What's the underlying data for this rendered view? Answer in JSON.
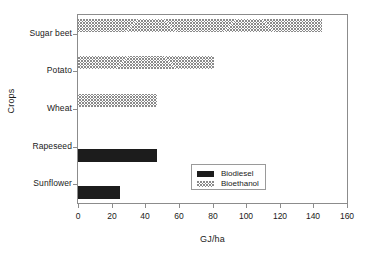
{
  "chart_data": {
    "type": "bar",
    "orientation": "horizontal",
    "title": "",
    "xlabel": "GJ/ha",
    "ylabel": "Crops",
    "categories": [
      "Sunflower",
      "Rapeseed",
      "Wheat",
      "Potato",
      "Sugar beet"
    ],
    "series": [
      {
        "name": "Biodiesel",
        "color": "#1c1c1c",
        "fill": "solid",
        "values": [
          25,
          47,
          null,
          null,
          null
        ]
      },
      {
        "name": "Bioethanol",
        "color": "#8a8a8a",
        "fill": "hatched",
        "values": [
          null,
          null,
          47,
          81,
          145
        ]
      }
    ],
    "xlim": [
      0,
      160
    ],
    "xticks": [
      0,
      20,
      40,
      60,
      80,
      100,
      120,
      140,
      160
    ],
    "xtick_labels": [
      "0",
      "20",
      "40",
      "60",
      "80",
      "100",
      "120",
      "140",
      "160"
    ],
    "grid": false,
    "legend_position": "center-right",
    "legend_entries": [
      "Biodiesel",
      "Bioethanol"
    ]
  },
  "axes": {
    "x_title": "GJ/ha",
    "y_title": "Crops"
  },
  "legend": {
    "items": [
      {
        "label": "Biodiesel"
      },
      {
        "label": "Bioethanol"
      }
    ]
  }
}
